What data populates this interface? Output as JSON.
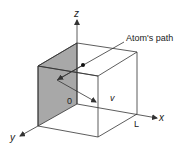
{
  "diagram": {
    "type": "3d-box-with-particle-path",
    "labels": {
      "z_axis": "z",
      "x_axis": "x",
      "y_axis": "y",
      "origin": "0",
      "velocity": "v",
      "length": "L",
      "path": "Atom's path"
    },
    "colors": {
      "line": "#333333",
      "shaded_face": "#a8a8a8",
      "background": "#ffffff"
    },
    "geometry": {
      "origin": [
        77,
        104
      ],
      "top_face": [
        [
          77,
          43
        ],
        [
          137,
          52
        ],
        [
          98,
          76
        ],
        [
          38,
          66
        ]
      ],
      "front_face": [
        [
          38,
          66
        ],
        [
          98,
          76
        ],
        [
          98,
          137
        ],
        [
          38,
          126
        ]
      ],
      "shaded_face": [
        [
          77,
          43
        ],
        [
          38,
          66
        ],
        [
          38,
          126
        ],
        [
          77,
          104
        ]
      ],
      "atom_dot": [
        83,
        65
      ],
      "reflection_point": [
        57,
        80
      ],
      "path_end": [
        96,
        102
      ]
    }
  }
}
